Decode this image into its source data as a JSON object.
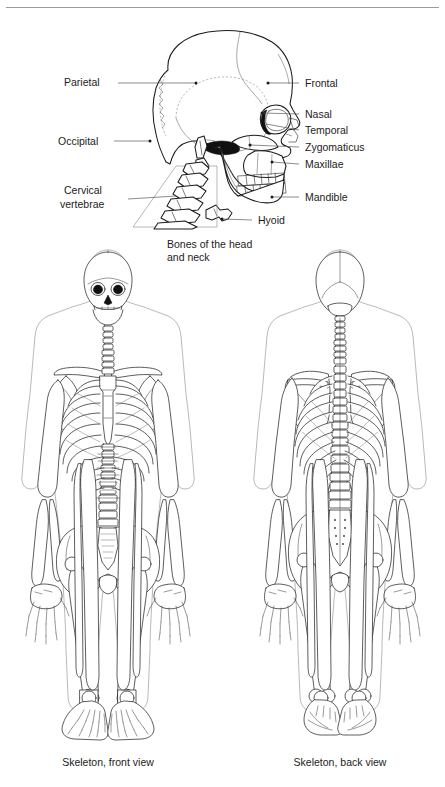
{
  "plate": {
    "title": "Bones of the head and neck; Skeleton front and back views",
    "background": "#ffffff",
    "ink": "#1c1c1c",
    "leader_color": "#5a5a5a"
  },
  "figures": [
    {
      "id": "skull-lateral",
      "caption": "Bones of the head\nand neck",
      "view": "lateral",
      "labels_left": [
        {
          "text": "Parietal",
          "x": 66,
          "y": 72,
          "line_from": [
            118,
            69
          ],
          "line_to": [
            196,
            69
          ],
          "dot": [
            196,
            69
          ]
        },
        {
          "text": "Occipital",
          "x": 60,
          "y": 130,
          "line_from": [
            118,
            127
          ],
          "line_to": [
            150,
            127
          ],
          "dot": [
            150,
            127
          ]
        },
        {
          "text": "Cervical\nvertebrae",
          "x": 66,
          "y": 178,
          "line_from": [
            130,
            185
          ],
          "line_to": [
            176,
            182
          ],
          "dot": null
        }
      ],
      "labels_right": [
        {
          "text": "Frontal",
          "x": 305,
          "y": 72,
          "line_from": [
            268,
            69
          ],
          "line_to": [
            267,
            69
          ],
          "dot": [
            267,
            69
          ]
        },
        {
          "text": "Nasal",
          "x": 305,
          "y": 103,
          "line_from": [
            290,
            100
          ],
          "line_to": [
            262,
            99
          ],
          "dot": [
            262,
            99
          ]
        },
        {
          "text": "Temporal",
          "x": 305,
          "y": 119,
          "line_from": [
            290,
            116
          ],
          "line_to": [
            264,
            110
          ],
          "dot": null
        },
        {
          "text": "Zygomaticus",
          "x": 305,
          "y": 136,
          "line_from": [
            290,
            133
          ],
          "line_to": [
            250,
            131
          ],
          "dot": [
            250,
            131
          ]
        },
        {
          "text": "Maxillae",
          "x": 305,
          "y": 153,
          "line_from": [
            290,
            150
          ],
          "line_to": [
            270,
            148
          ],
          "dot": [
            270,
            148
          ]
        },
        {
          "text": "Mandible",
          "x": 305,
          "y": 186,
          "line_from": [
            290,
            183
          ],
          "line_to": [
            271,
            183
          ],
          "dot": [
            271,
            183
          ]
        },
        {
          "text": "Hyoid",
          "x": 259,
          "y": 209,
          "line_from": [
            248,
            206
          ],
          "line_to": [
            222,
            205
          ],
          "dot": [
            222,
            205
          ]
        }
      ]
    },
    {
      "id": "skeleton-front",
      "caption": "Skeleton, front view",
      "view": "anterior"
    },
    {
      "id": "skeleton-back",
      "caption": "Skeleton, back view",
      "view": "posterior"
    }
  ]
}
